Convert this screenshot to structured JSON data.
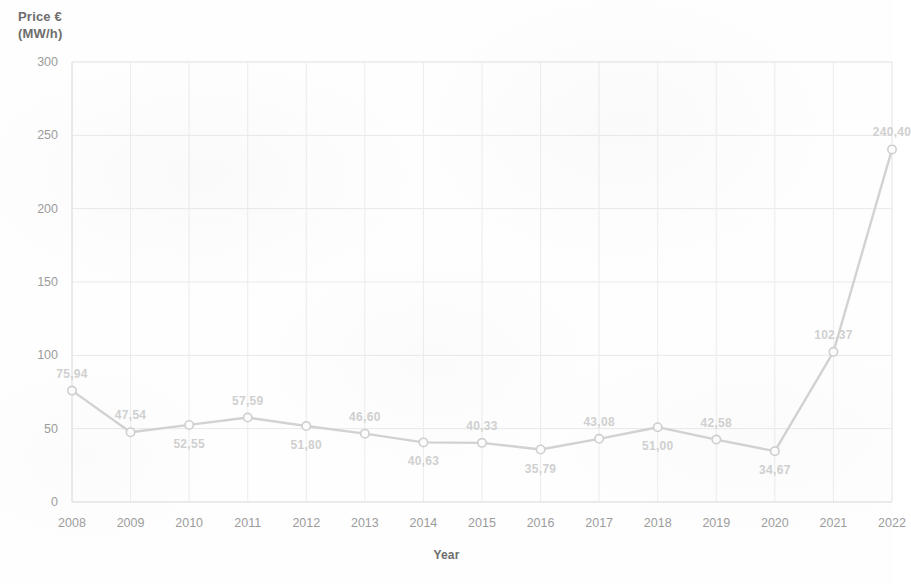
{
  "chart_data": {
    "type": "line",
    "title": "",
    "xlabel": "Year",
    "ylabel": "Price €\n(MW/h)",
    "ylabel_line1": "Price €",
    "ylabel_line2": "(MW/h)",
    "categories": [
      "2008",
      "2009",
      "2010",
      "2011",
      "2012",
      "2013",
      "2014",
      "2015",
      "2016",
      "2017",
      "2018",
      "2019",
      "2020",
      "2021",
      "2022"
    ],
    "values": [
      75.94,
      47.54,
      52.55,
      57.59,
      51.8,
      46.6,
      40.63,
      40.33,
      35.79,
      43.08,
      51.0,
      42.58,
      34.67,
      102.37,
      240.4
    ],
    "point_labels": [
      "75,94",
      "47,54",
      "52,55",
      "57,59",
      "51,80",
      "46,60",
      "40,63",
      "40,33",
      "35,79",
      "43,08",
      "51,00",
      "42,58",
      "34,67",
      "102,37",
      "240,40"
    ],
    "label_positions": [
      "above",
      "above",
      "below",
      "above",
      "below",
      "above",
      "below",
      "above",
      "below",
      "above",
      "below",
      "above",
      "below",
      "above",
      "above"
    ],
    "yticks": [
      0,
      50,
      100,
      150,
      200,
      250,
      300
    ],
    "ytick_labels": [
      "0",
      "50",
      "100",
      "150",
      "200",
      "250",
      "300"
    ],
    "ylim": [
      0,
      300
    ],
    "grid": true,
    "legend": "none",
    "line_color": "#d2d2d2",
    "marker_color": "#cfcfcf",
    "label_color": "#d0d0d0",
    "tick_color": "#9c9c9c",
    "title_color": "#6d6d6d"
  }
}
